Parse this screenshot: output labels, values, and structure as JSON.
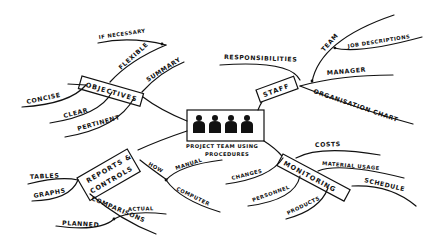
{
  "diagram": {
    "type": "mind-map",
    "central_topic": {
      "label_line1": "PROJECT TEAM USING",
      "label_line2": "PROCEDURES",
      "icon": "four-people-icon"
    },
    "branches": [
      {
        "label": "OBJECTIVES",
        "children": [
          {
            "label": "FLEXIBLE",
            "children": [
              {
                "label": "IF NECESSARY"
              }
            ]
          },
          {
            "label": "SUMMARY"
          },
          {
            "label": "CONCISE"
          },
          {
            "label": "CLEAR"
          },
          {
            "label": "PERTINENT"
          }
        ]
      },
      {
        "label": "STAFF",
        "children": [
          {
            "label": "RESPONSIBILITIES"
          },
          {
            "label": "TEAM",
            "children": [
              {
                "label": "JOB DESCRIPTIONS"
              }
            ]
          },
          {
            "label": "MANAGER"
          },
          {
            "label": "ORGANISATION CHART"
          }
        ]
      },
      {
        "label_line1": "REPORTS &",
        "label_line2": "CONTROLS",
        "children": [
          {
            "label": "TABLES"
          },
          {
            "label": "GRAPHS"
          },
          {
            "label": "HOW",
            "children": [
              {
                "label": "MANUAL"
              },
              {
                "label": "COMPUTER"
              }
            ]
          },
          {
            "label": "COMPARISONS",
            "children": [
              {
                "label": "ACTUAL"
              },
              {
                "label": "PLANNED"
              }
            ]
          }
        ]
      },
      {
        "label": "MONITORING",
        "children": [
          {
            "label": "COSTS"
          },
          {
            "label": "MATERIAL USAGE"
          },
          {
            "label": "SCHEDULE"
          },
          {
            "label": "CHANGES"
          },
          {
            "label": "PERSONNEL"
          },
          {
            "label": "PRODUCTS"
          }
        ]
      }
    ]
  }
}
